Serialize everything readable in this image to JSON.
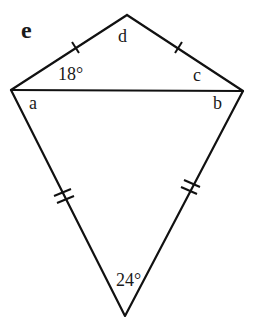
{
  "figure": {
    "title": "e",
    "type": "kite",
    "vertices": {
      "top": [
        127,
        15
      ],
      "left": [
        11,
        90
      ],
      "right": [
        243,
        91
      ],
      "bottom": [
        125,
        316
      ]
    },
    "labels": {
      "d": "d",
      "c": "c",
      "a": "a",
      "b": "b"
    },
    "angles": {
      "top_left": "18°",
      "bottom": "24°"
    },
    "tick_marks": {
      "upper_sides": "single",
      "lower_sides": "double"
    },
    "colors": {
      "stroke": "#111111",
      "background": "#ffffff"
    }
  }
}
